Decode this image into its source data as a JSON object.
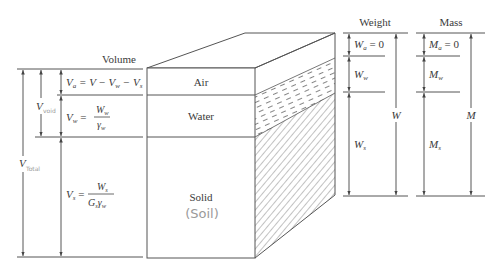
{
  "diagram": {
    "type": "soil-phase-diagram",
    "columns": {
      "volume": {
        "title": "Volume"
      },
      "weight": {
        "title": "Weight"
      },
      "mass": {
        "title": "Mass"
      }
    },
    "phases": [
      {
        "name": "Air",
        "label": "Air"
      },
      {
        "name": "Water",
        "label": "Water"
      },
      {
        "name": "Solid",
        "label": "Solid",
        "annotation": "(Soil)"
      }
    ],
    "volume_labels": {
      "Va": {
        "lhs": "V",
        "lhs_sub": "a",
        "rhs": "= V − V",
        "rhs_sub1": "w",
        "rhs_mid": " − V",
        "rhs_sub2": "s"
      },
      "Vw": {
        "lhs": "V",
        "lhs_sub": "w",
        "num": "W",
        "num_sub": "w",
        "den": "γ",
        "den_sub": "w"
      },
      "Vs": {
        "lhs": "V",
        "lhs_sub": "s",
        "num": "W",
        "num_sub": "s",
        "den_a": "G",
        "den_a_sub": "s",
        "den_b": "γ",
        "den_b_sub": "w"
      },
      "Vv": {
        "main": "V",
        "handwritten_sub": "void"
      },
      "V": {
        "main": "V",
        "handwritten_sub": "Total"
      }
    },
    "weight_labels": {
      "Wa": {
        "main": "W",
        "sub": "a",
        "value": "= 0"
      },
      "Ww": {
        "main": "W",
        "sub": "w"
      },
      "Ws": {
        "main": "W",
        "sub": "s"
      },
      "W": {
        "main": "W"
      }
    },
    "mass_labels": {
      "Ma": {
        "main": "M",
        "sub": "a",
        "value": "= 0"
      },
      "Mw": {
        "main": "M",
        "sub": "w"
      },
      "Ms": {
        "main": "M",
        "sub": "s"
      },
      "M": {
        "main": "M"
      }
    },
    "colors": {
      "line": "#555555",
      "text": "#3a3a3a",
      "handwriting": "#9a9a9a"
    }
  }
}
